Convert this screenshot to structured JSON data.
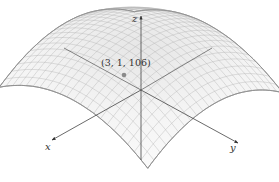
{
  "figure": {
    "type": "3d-surface",
    "axes": {
      "x_label": "x",
      "y_label": "y",
      "z_label": "z"
    },
    "point": {
      "label": "(3, 1, 106)",
      "x": 3,
      "y": 1,
      "z": 106
    },
    "colors": {
      "mesh": "#b5b5b5",
      "surface_fill": "#f4f4f4",
      "axes": "#444444",
      "point": "#8a8a8a"
    }
  }
}
